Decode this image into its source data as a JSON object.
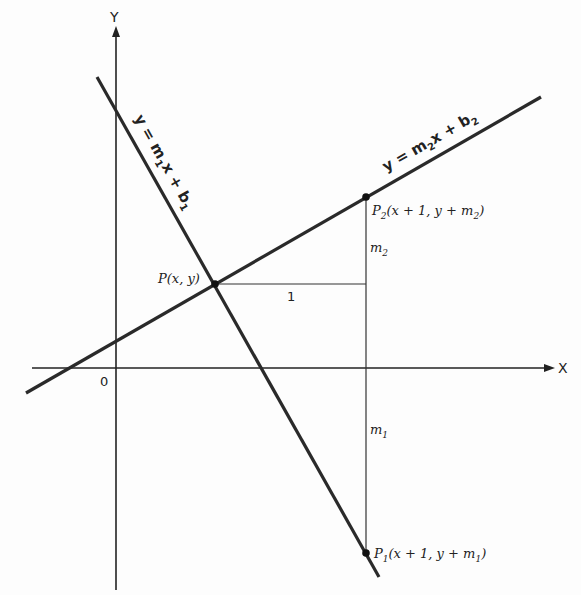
{
  "diagram": {
    "axes": {
      "x_label": "X",
      "y_label": "Y",
      "origin_label": "0"
    },
    "lines": [
      {
        "name": "line-1",
        "equation_parts": [
          "y = m",
          "1",
          "x + b",
          "1"
        ],
        "equation": "y = m1x + b1"
      },
      {
        "name": "line-2",
        "equation_parts": [
          "y = m",
          "2",
          "x + b",
          "2"
        ],
        "equation": "y = m2x + b2"
      }
    ],
    "points": {
      "p": "P(x, y)",
      "p2": {
        "main": "P",
        "sub": "2",
        "rest": "(x + 1, y + m",
        "sub2": "2",
        "end": ")"
      },
      "p1": {
        "main": "P",
        "sub": "1",
        "rest": "(x + 1, y + m",
        "sub2": "1",
        "end": ")"
      }
    },
    "segments": {
      "run_label": "1",
      "rise2": {
        "main": "m",
        "sub": "2"
      },
      "rise1": {
        "main": "m",
        "sub": "1"
      }
    }
  }
}
